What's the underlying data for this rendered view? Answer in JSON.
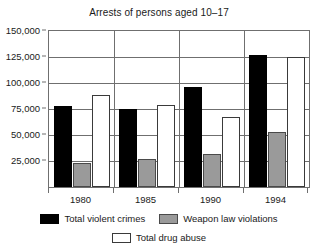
{
  "chart_data": {
    "type": "bar",
    "title": "Arrests of persons aged 10–17",
    "xlabel": "",
    "ylabel": "",
    "categories": [
      "1980",
      "1985",
      "1990",
      "1994"
    ],
    "series": [
      {
        "name": "Total violent crimes",
        "values": [
          78000,
          75000,
          96000,
          127000
        ],
        "color": "#000000"
      },
      {
        "name": "Weapon law violations",
        "values": [
          23000,
          27000,
          32000,
          53000
        ],
        "color": "#9a9a9a"
      },
      {
        "name": "Total drug abuse",
        "values": [
          88000,
          79000,
          67000,
          125000
        ],
        "color": "#ffffff"
      }
    ],
    "ylim": [
      0,
      150000
    ],
    "yticks": [
      25000,
      50000,
      75000,
      100000,
      125000,
      150000
    ],
    "ytick_labels": [
      "25,000",
      "50,000",
      "75,000",
      "100,000",
      "125,000",
      "150,000"
    ],
    "grid": true,
    "grid_axis": "y",
    "legend_position": "bottom",
    "legend_entries": [
      "Total violent crimes",
      "Weapon law violations",
      "Total drug abuse"
    ]
  }
}
